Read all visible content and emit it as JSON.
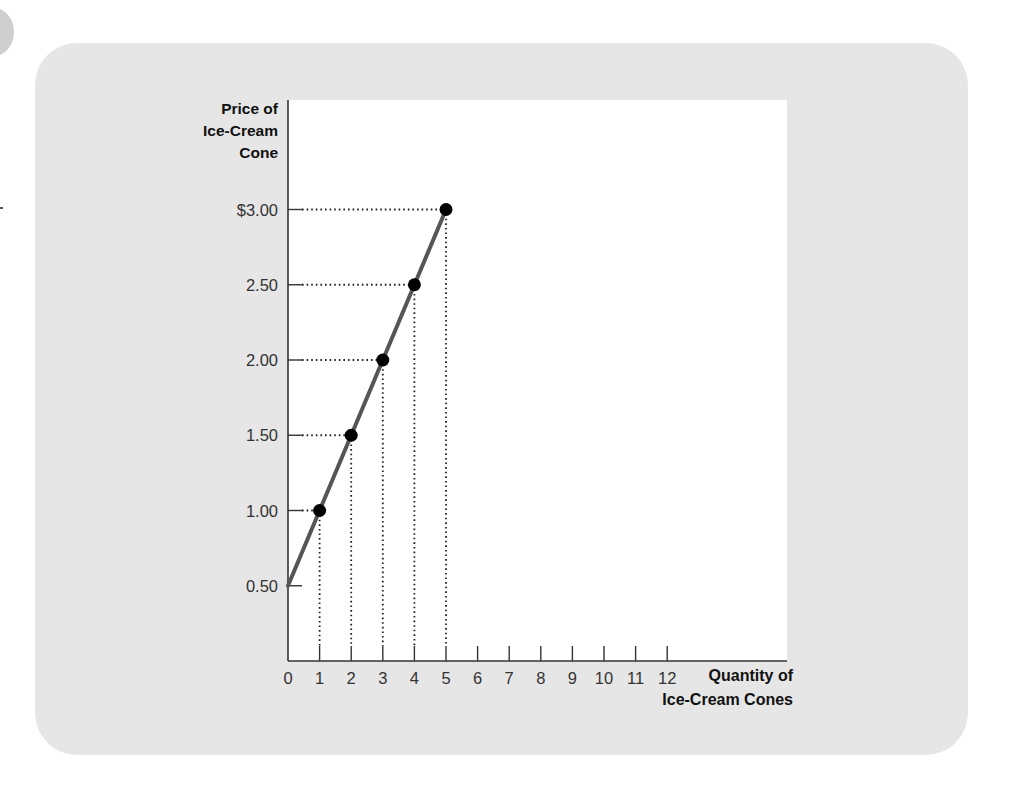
{
  "chart_data": {
    "type": "line",
    "title": "",
    "xlabel": "Quantity of Ice-Cream Cones",
    "ylabel": "Price of Ice-Cream Cone",
    "ylabel_lines": [
      "Price of",
      "Ice-Cream",
      "Cone"
    ],
    "xlabel_lines": [
      "Quantity of",
      "Ice-Cream Cones"
    ],
    "x_ticks": [
      "0",
      "1",
      "2",
      "3",
      "4",
      "5",
      "6",
      "7",
      "8",
      "9",
      "10",
      "11",
      "12"
    ],
    "y_ticks": [
      "0.50",
      "1.00",
      "1.50",
      "2.00",
      "2.50",
      "$3.00"
    ],
    "xlim": [
      0,
      15.8
    ],
    "ylim": [
      0,
      3.6
    ],
    "grid": false,
    "legend": null,
    "series": [
      {
        "name": "Supply",
        "line_from": {
          "x": 0,
          "y": 0.5
        },
        "points": [
          {
            "x": 1,
            "y": 1.0
          },
          {
            "x": 2,
            "y": 1.5
          },
          {
            "x": 3,
            "y": 2.0
          },
          {
            "x": 4,
            "y": 2.5
          },
          {
            "x": 5,
            "y": 3.0
          }
        ],
        "color": "#555555",
        "marker_color": "#000000"
      }
    ],
    "annotations": "Dotted guide lines from each point to both axes"
  },
  "colors": {
    "card_background": "#e6e6e6",
    "plot_background": "#ffffff",
    "line": "#555555",
    "marker": "#000000",
    "axis": "#333333"
  }
}
